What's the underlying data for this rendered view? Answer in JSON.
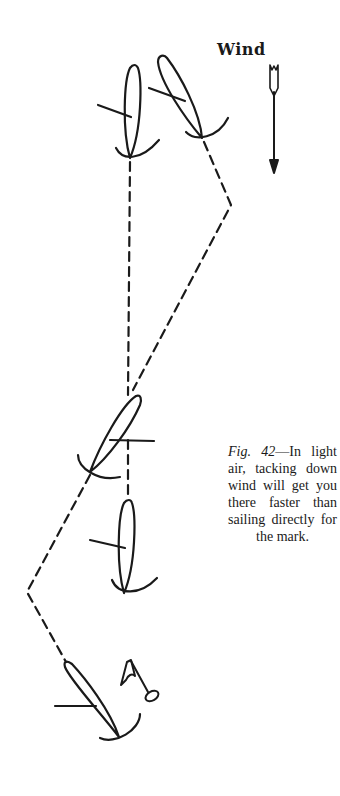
{
  "wind": {
    "label": "Wind",
    "icon": "arrow-down-icon"
  },
  "caption": {
    "figure_number": "Fig. 42",
    "dash": "—",
    "text": "In light air, tacking down wind will get you there faster than sailing directly for the mark."
  },
  "colors": {
    "ink": "#1a1a1a",
    "paper": "#ffffff"
  }
}
